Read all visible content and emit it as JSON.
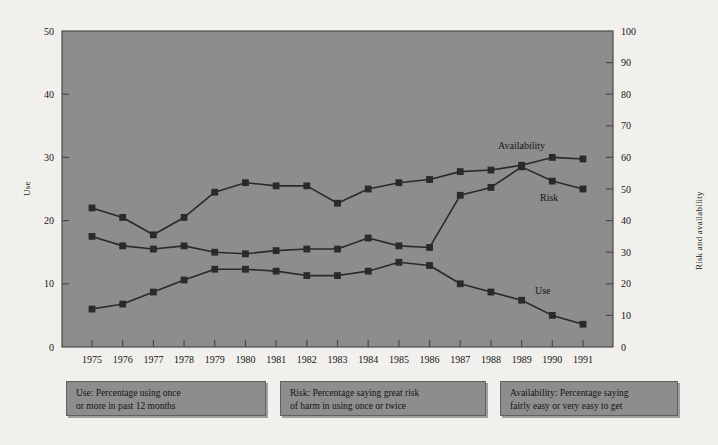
{
  "chart_data": {
    "type": "line",
    "title": "",
    "xlabel": "",
    "ylabel": "Use",
    "y2label": "Risk and availability",
    "x": [
      1975,
      1976,
      1977,
      1978,
      1979,
      1980,
      1981,
      1982,
      1983,
      1984,
      1985,
      1986,
      1987,
      1988,
      1989,
      1990,
      1991
    ],
    "xticklabels": [
      "1975",
      "1976",
      "1977",
      "1978",
      "1979",
      "1980",
      "1981",
      "1982",
      "1983",
      "1984",
      "1985",
      "1986",
      "1987",
      "1988",
      "1989",
      "1990",
      "1991"
    ],
    "ylim": [
      0,
      50
    ],
    "yticks": [
      0,
      10,
      20,
      30,
      40,
      50
    ],
    "yticklabels": [
      "0",
      "10",
      "20",
      "30",
      "40",
      "50"
    ],
    "y2lim": [
      0,
      100
    ],
    "y2ticks": [
      0,
      10,
      20,
      30,
      40,
      50,
      60,
      70,
      80,
      90,
      100
    ],
    "y2ticklabels": [
      "0",
      "10",
      "20",
      "30",
      "40",
      "50",
      "60",
      "70",
      "80",
      "90",
      "100"
    ],
    "grid": false,
    "legend_position": "below-plot",
    "series": [
      {
        "name": "Use",
        "axis": "left",
        "annotation": "Use",
        "values": [
          6.0,
          6.8,
          8.7,
          10.6,
          12.3,
          12.3,
          12.0,
          11.3,
          11.3,
          12.0,
          13.4,
          12.9,
          10.0,
          8.7,
          7.4,
          5.0,
          3.6
        ]
      },
      {
        "name": "Risk",
        "axis": "right",
        "annotation": "Risk",
        "values": [
          35.0,
          32.0,
          31.0,
          32.0,
          30.0,
          29.5,
          30.5,
          31.0,
          31.0,
          34.5,
          32.0,
          31.5,
          48.0,
          50.5,
          57.0,
          52.5,
          50.0
        ]
      },
      {
        "name": "Availability",
        "axis": "right",
        "annotation": "Availability",
        "values": [
          44.0,
          41.0,
          35.5,
          41.0,
          49.0,
          52.0,
          51.0,
          51.0,
          45.5,
          50.0,
          52.0,
          53.0,
          55.5,
          56.0,
          57.5,
          60.0,
          59.5
        ]
      }
    ],
    "legend_notes": [
      {
        "id": "use",
        "line1": "Use: Percentage using once",
        "line2": "or more in past 12 months"
      },
      {
        "id": "risk",
        "line1": "Risk: Percentage saying great risk",
        "line2": "of harm in using once or twice"
      },
      {
        "id": "availability",
        "line1": "Availability: Percentage saying",
        "line2": "fairly easy or very easy to get"
      }
    ],
    "colors": {
      "page_background": "#f2f0ed",
      "plot_background": "#8d8d8d",
      "plot_border": "#4a4a4a",
      "series_marker": "#2a2a2a",
      "series_line": "#2a2a2a",
      "text": "#141414"
    }
  }
}
